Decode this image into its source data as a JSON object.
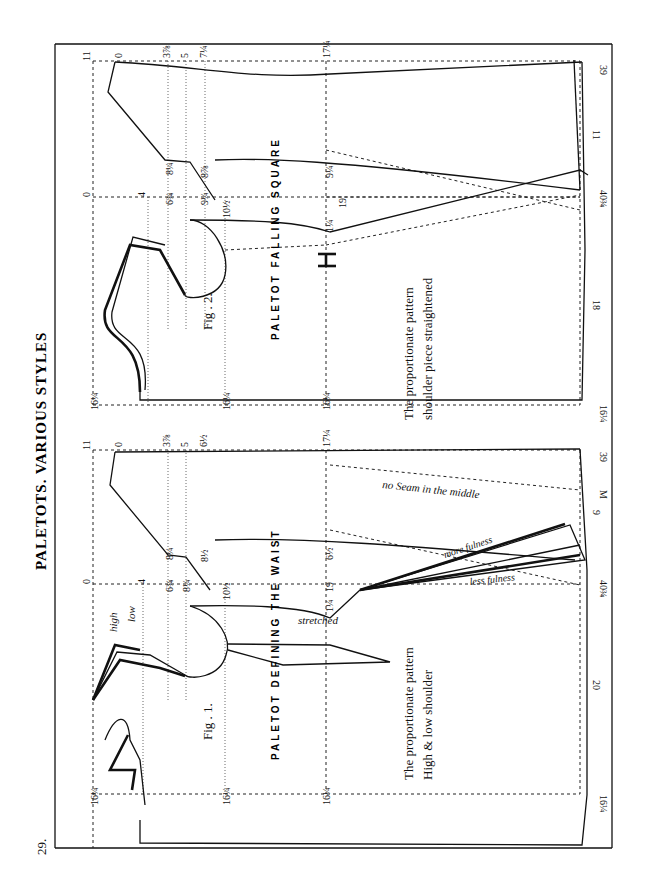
{
  "page": {
    "number": "29.",
    "title": "PALETOTS. VARIOUS STYLES",
    "orientation": "rotated 90° counter-clockwise"
  },
  "figures": [
    {
      "id": "fig1",
      "caption": "Fig . 1.",
      "heading": "PALETOT DEFINING THE WAIST",
      "notes": [
        "The proportionate pattern",
        "High & low shoulder"
      ],
      "annotations": {
        "high": "high",
        "low": "low",
        "stretched": "stretched",
        "no_seam": "no Seam in the middle",
        "more_fulness": "more fulness",
        "less_fulness": "less fulness"
      },
      "measurements": {
        "top_edge": [
          "11",
          "0",
          "3⅞",
          "5",
          "6½",
          "17¼",
          "39"
        ],
        "back": [
          "1¾",
          "2¾",
          "1½",
          "1½"
        ],
        "armhole": [
          "8¼",
          "8½",
          "6¾",
          "8¼",
          "10½",
          "4"
        ],
        "waist": [
          "1¼",
          "19",
          "6½",
          "M"
        ],
        "front": [
          "1¾",
          "6¾",
          "4¾",
          "5",
          "6½",
          "9½",
          "1½",
          "6¾",
          "16¼",
          "16¼",
          "16¼",
          "16¼",
          "20",
          "9",
          "40¾",
          "0"
        ]
      }
    },
    {
      "id": "fig2",
      "caption": "Fig . 2.",
      "heading": "PALETOT FALLING SQUARE",
      "notes": [
        "The proportionate pattern",
        "shoulder piece straightened"
      ],
      "measurements": {
        "top_edge": [
          "11",
          "0",
          "3⅞",
          "5",
          "7¼",
          "17¼",
          "39"
        ],
        "back": [
          "1¾",
          "2¾",
          "2½",
          "1½"
        ],
        "armhole": [
          "8¼",
          "8⅞",
          "6¾",
          "9¼",
          "10½",
          "4"
        ],
        "waist": [
          "1¼",
          "19",
          "9¼"
        ],
        "front": [
          "1¾",
          "4¾",
          "6¾",
          "10¾",
          "9½",
          "5½",
          "1½",
          "14¾",
          "16¼",
          "16¼",
          "16¼",
          "16¼",
          "18",
          "11",
          "40¾",
          "0"
        ]
      }
    }
  ]
}
